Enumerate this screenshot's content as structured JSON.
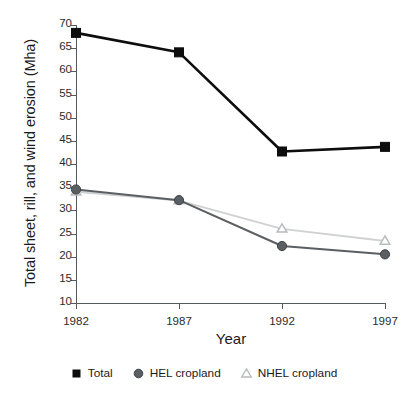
{
  "chart_data": {
    "type": "line",
    "title": "",
    "xlabel": "Year",
    "ylabel": "Total sheet, rill, and wind erosion (Mha)",
    "categories": [
      "1982",
      "1987",
      "1992",
      "1997"
    ],
    "x": [
      1982,
      1987,
      1992,
      1997
    ],
    "xlim": [
      1982,
      1997
    ],
    "ylim": [
      10,
      70
    ],
    "yticks": [
      10,
      15,
      20,
      25,
      30,
      35,
      40,
      45,
      50,
      55,
      60,
      65,
      70
    ],
    "xticks": [
      1982,
      1987,
      1992,
      1997
    ],
    "grid": false,
    "legend_position": "below-axis-center",
    "series": [
      {
        "name": "Total",
        "marker": "filled-square",
        "color": "#0d0d0d",
        "line_color": "#0d0d0d",
        "values": [
          68.3,
          64.1,
          42.7,
          43.7
        ]
      },
      {
        "name": "HEL cropland",
        "marker": "filled-circle",
        "color": "#5a5f63",
        "line_color": "#5a5f63",
        "values": [
          34.5,
          32.2,
          22.3,
          20.5
        ]
      },
      {
        "name": "NHEL cropland",
        "marker": "open-triangle",
        "color": "#b9bbbd",
        "line_color": "#cfd1d3",
        "values": [
          34.0,
          32.1,
          26.0,
          23.4
        ]
      }
    ]
  },
  "axes": {
    "y_title": "Total sheet, rill, and wind erosion (Mha)",
    "x_title": "Year",
    "y_tick_labels": [
      "70",
      "65",
      "60",
      "55",
      "50",
      "45",
      "40",
      "35",
      "30",
      "25",
      "20",
      "15",
      "10"
    ],
    "x_tick_labels": [
      "1982",
      "1987",
      "1992",
      "1997"
    ]
  },
  "legend": {
    "items": [
      {
        "label": "Total",
        "marker": "filled-square-icon"
      },
      {
        "label": "HEL cropland",
        "marker": "filled-circle-icon"
      },
      {
        "label": "NHEL cropland",
        "marker": "open-triangle-icon"
      }
    ]
  },
  "colors": {
    "total": "#0d0d0d",
    "hel": "#5a5f63",
    "nhel_marker": "#b9bbbd",
    "nhel_line": "#cfd1d3",
    "axis": "#555a5c",
    "text": "#1a1a1a",
    "background": "#ffffff"
  }
}
